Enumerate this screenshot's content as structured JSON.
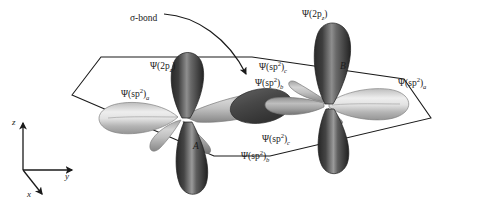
{
  "figure": {
    "type": "orbital-diagram",
    "background_color": "#ffffff",
    "line_color": "#1a1a1a"
  },
  "labels": {
    "sigma_bond": "σ-bond",
    "pz_right": {
      "psi": "Ψ",
      "open": "(2p",
      "sub": "z",
      "close": ")"
    },
    "pz_left": {
      "psi": "Ψ",
      "open": "(2p",
      "sub": "z",
      "close": ")"
    },
    "sp2_a_left": {
      "psi": "Ψ",
      "open": "(sp",
      "sup": "2",
      "close": ")",
      "sub": "a"
    },
    "sp2_a_right": {
      "psi": "Ψ",
      "open": "(sp",
      "sup": "2",
      "close": ")",
      "sub": "a"
    },
    "sp2_c_top": {
      "psi": "Ψ",
      "open": "(sp",
      "sup": "2",
      "close": ")",
      "sub": "c"
    },
    "sp2_b_top": {
      "psi": "Ψ",
      "open": "(sp",
      "sup": "2",
      "close": ")",
      "sub": "b"
    },
    "sp2_c_bottom": {
      "psi": "Ψ",
      "open": "(sp",
      "sup": "2",
      "close": ")",
      "sub": "c"
    },
    "sp2_b_bottom": {
      "psi": "Ψ",
      "open": "(sp",
      "sup": "2",
      "close": ")",
      "sub": "b"
    },
    "atom_a": "A",
    "atom_b": "B"
  },
  "axes": {
    "z": "z",
    "y": "y",
    "x": "x"
  },
  "colors": {
    "lobe_dark": "#3a3a3a",
    "lobe_dark_edge": "#1c1c1c",
    "lobe_light": "#c9c9c9",
    "lobe_light_edge": "#8a8a8a",
    "lobe_mid": "#9a9a9a",
    "overlap_dark": "#4a4a4a",
    "plane_stroke": "#1a1a1a",
    "text": "#1a1a1a"
  }
}
